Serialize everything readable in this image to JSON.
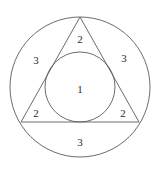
{
  "figure": {
    "background_color": "#ffffff",
    "stroke_color": "#5a5a5a",
    "label_color": "#2b2b2b",
    "shapes": {
      "outer_circle": {
        "name": "outer-circle",
        "cx": 80,
        "cy": 87,
        "r": 70
      },
      "triangle": {
        "name": "inscribed-triangle",
        "points": "80,17 139,122 21,122",
        "apex": "80,17",
        "base_left": "21,122",
        "base_right": "139,122"
      },
      "inner_circle": {
        "name": "inner-circle",
        "cx": 80,
        "cy": 87,
        "r": 35
      }
    },
    "labels": [
      {
        "id": "label-center-1",
        "text": "1",
        "x": 80,
        "y": 89,
        "region": "inner-circle"
      },
      {
        "id": "label-top-2",
        "text": "2",
        "x": 80,
        "y": 39,
        "region": "top-triangle-corner"
      },
      {
        "id": "label-bottom-left-2",
        "text": "2",
        "x": 36,
        "y": 113,
        "region": "bottom-left-triangle-corner"
      },
      {
        "id": "label-bottom-right-2",
        "text": "2",
        "x": 123,
        "y": 113,
        "region": "bottom-right-triangle-corner"
      },
      {
        "id": "label-left-3",
        "text": "3",
        "x": 36,
        "y": 60,
        "region": "left-circular-segment"
      },
      {
        "id": "label-right-3",
        "text": "3",
        "x": 124,
        "y": 58,
        "region": "right-circular-segment"
      },
      {
        "id": "label-bottom-3",
        "text": "3",
        "x": 80,
        "y": 142,
        "region": "bottom-circular-segment"
      }
    ]
  }
}
